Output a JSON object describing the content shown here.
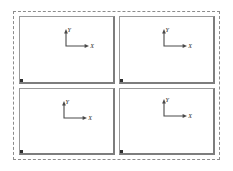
{
  "document": {
    "title": "Four-panel axis layout",
    "background_color": "#ffffff"
  },
  "selection_frame": {
    "name": "selection-frame",
    "border_style": "dotted",
    "border_color": "#8c8c8c"
  },
  "grid": {
    "rows": 2,
    "columns": 2,
    "panel_border_color": "#9a9a9a",
    "panel_fill_color": "#ffffff",
    "handle_color": "#303030"
  },
  "axis": {
    "line_color": "#4a4a4a",
    "label_color": "#2b2b2b",
    "y_label": "Y",
    "x_label": "X"
  },
  "panels": [
    {
      "id": "panel-top-left",
      "position": "top-left",
      "axis": {
        "y_label": "Y",
        "x_label": "X"
      },
      "handle": true
    },
    {
      "id": "panel-top-right",
      "position": "top-right",
      "axis": {
        "y_label": "Y",
        "x_label": "X"
      },
      "handle": true
    },
    {
      "id": "panel-bottom-left",
      "position": "bottom-left",
      "axis": {
        "y_label": "Y",
        "x_label": "X"
      },
      "handle": true
    },
    {
      "id": "panel-bottom-right",
      "position": "bottom-right",
      "axis": {
        "y_label": "Y",
        "x_label": "X"
      },
      "handle": true
    }
  ]
}
